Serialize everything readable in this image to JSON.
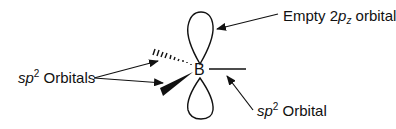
{
  "diagram": {
    "atom": {
      "symbol": "B"
    },
    "labels": {
      "sp2_orbitals": {
        "prefix": "sp",
        "superscript": "2",
        "suffix": " Orbitals"
      },
      "empty_p": {
        "prefix": "Empty 2",
        "italic": "p",
        "subscript": "z",
        "suffix": " orbital"
      },
      "sp2_orbital": {
        "prefix": "sp",
        "superscript": "2",
        "suffix": " Orbital"
      }
    },
    "colors": {
      "line": "#111111",
      "background": "#ffffff"
    }
  }
}
